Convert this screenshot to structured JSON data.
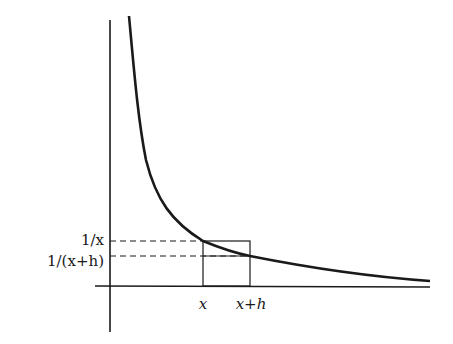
{
  "figure": {
    "function": "y = 1/x",
    "labels": {
      "y_upper": "1/x",
      "y_lower": "1/(x+h)",
      "x_left": "x",
      "x_right": "x+h"
    },
    "colors": {
      "ink": "#1a1a1a",
      "background": "#ffffff"
    }
  }
}
